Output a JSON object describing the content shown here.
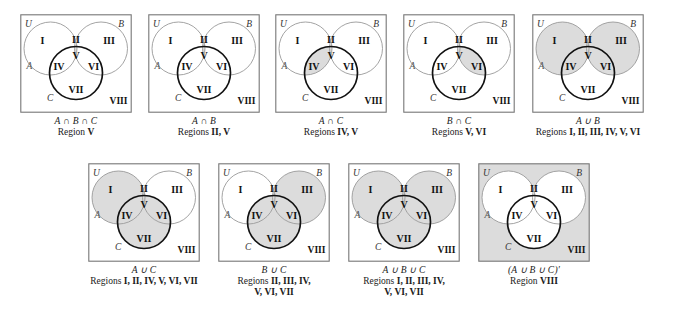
{
  "figure": {
    "region_labels": [
      "I",
      "II",
      "III",
      "IV",
      "V",
      "VI",
      "VII",
      "VIII"
    ],
    "set_labels": {
      "universe": "U",
      "a": "A",
      "b": "B",
      "c": "C"
    },
    "shade_color": "#dcdcdc",
    "circle_a_color": "#999999",
    "circle_b_color": "#999999",
    "circle_c_color": "#111111",
    "box_border_color": "#777777"
  },
  "panels": [
    {
      "id": "a-int-b-int-c",
      "expr": "A ∩ B ∩ C",
      "regions_prefix": "Region ",
      "regions_text": "V",
      "regions_line2": "",
      "shaded": [
        "V"
      ],
      "shade_universe": false
    },
    {
      "id": "a-int-b",
      "expr": "A ∩ B",
      "regions_prefix": "Regions ",
      "regions_text": "II, V",
      "regions_line2": "",
      "shaded": [
        "II",
        "V"
      ],
      "shade_universe": false
    },
    {
      "id": "a-int-c",
      "expr": "A ∩ C",
      "regions_prefix": "Regions ",
      "regions_text": "IV, V",
      "regions_line2": "",
      "shaded": [
        "IV",
        "V"
      ],
      "shade_universe": false
    },
    {
      "id": "b-int-c",
      "expr": "B ∩ C",
      "regions_prefix": "Regions ",
      "regions_text": "V, VI",
      "regions_line2": "",
      "shaded": [
        "V",
        "VI"
      ],
      "shade_universe": false
    },
    {
      "id": "a-union-b",
      "expr": "A ∪ B",
      "regions_prefix": "Regions ",
      "regions_text": "I, II, III, IV, V, VI",
      "regions_line2": "",
      "shaded": [
        "I",
        "II",
        "III",
        "IV",
        "V",
        "VI"
      ],
      "shade_universe": false
    },
    {
      "id": "a-union-c",
      "expr": "A ∪ C",
      "regions_prefix": "Regions ",
      "regions_text": "I, II, IV, V, VI, VII",
      "regions_line2": "",
      "shaded": [
        "I",
        "II",
        "IV",
        "V",
        "VI",
        "VII"
      ],
      "shade_universe": false
    },
    {
      "id": "b-union-c",
      "expr": "B ∪ C",
      "regions_prefix": "Regions ",
      "regions_text": "II, III, IV,",
      "regions_line2": "V, VI, VII",
      "shaded": [
        "II",
        "III",
        "IV",
        "V",
        "VI",
        "VII"
      ],
      "shade_universe": false
    },
    {
      "id": "a-union-b-union-c",
      "expr": "A ∪ B ∪ C",
      "regions_prefix": "Regions ",
      "regions_text": "I, II, III, IV,",
      "regions_line2": "V, VI, VII",
      "shaded": [
        "I",
        "II",
        "III",
        "IV",
        "V",
        "VI",
        "VII"
      ],
      "shade_universe": false
    },
    {
      "id": "a-union-b-union-c-complement",
      "expr": "(A ∪ B ∪ C)′",
      "regions_prefix": "Region ",
      "regions_text": "VIII",
      "regions_line2": "",
      "shaded": [
        "VIII"
      ],
      "shade_universe": true
    }
  ],
  "layout": {
    "top_row_x": [
      20,
      148,
      275,
      403,
      532
    ],
    "top_row_y": 14,
    "bottom_row_x": [
      88,
      218,
      348,
      478
    ],
    "bottom_row_y": 163
  }
}
